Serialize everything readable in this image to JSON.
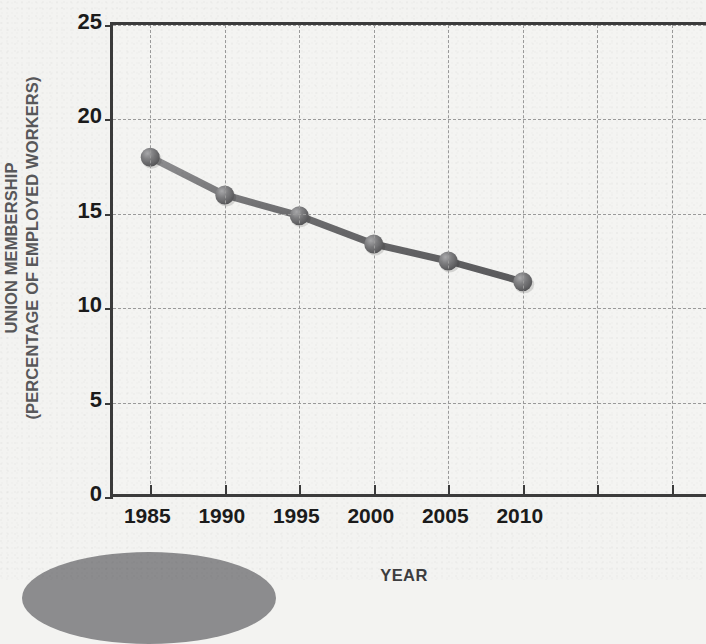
{
  "chart_data": {
    "type": "line",
    "title": "",
    "xlabel": "YEAR",
    "ylabel": "UNION MEMBERSHIP (PERCENTAGE OF EMPLOYED WORKERS)",
    "ylabel_lines": [
      "UNION MEMBERSHIP",
      "(PERCENTAGE OF EMPLOYED WORKERS)"
    ],
    "categories": [
      "1985",
      "1990",
      "1995",
      "2000",
      "2005",
      "2010"
    ],
    "x": [
      1985,
      1990,
      1995,
      2000,
      2005,
      2010
    ],
    "values": [
      18.0,
      16.0,
      14.9,
      13.4,
      12.5,
      11.4
    ],
    "series": [
      {
        "name": "Union membership",
        "values": [
          18.0,
          16.0,
          14.9,
          13.4,
          12.5,
          11.4
        ]
      }
    ],
    "ylim": [
      0,
      25
    ],
    "xlim": [
      1982.5,
      2022.5
    ],
    "y_ticks": [
      0,
      5,
      10,
      15,
      20,
      25
    ],
    "y_tick_labels": [
      "0",
      "5",
      "10",
      "15",
      "20",
      "25"
    ],
    "x_ticks": [
      1985,
      1990,
      1995,
      2000,
      2005,
      2010,
      2015,
      2020
    ],
    "x_tick_labels": [
      "1985",
      "1990",
      "1995",
      "2000",
      "2005",
      "2010"
    ],
    "grid": true,
    "grid_style": "dashed",
    "legend": "none",
    "marker": "sphere",
    "line_color": "#6f6f71",
    "marker_color": "#6b6b6d",
    "grid_color": "#9a9a9a",
    "axis_color": "#3b3b3b",
    "background_color": "#f3f3f1",
    "tick_label_color": "#1b1b1b",
    "axis_title_color": "#58585a"
  },
  "decor": {
    "ellipse_color": "#8c8c8e",
    "ellipse_name": "decorative-ellipse"
  }
}
